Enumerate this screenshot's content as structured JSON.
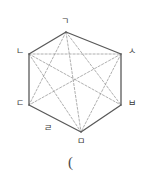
{
  "figure": {
    "name": "labeled-hexagon-with-diagonals",
    "outline_color": "#595959",
    "diagonal_color": "#9a9a9a",
    "background_color": "#ffffff",
    "vertices": [
      {
        "id": "A",
        "label": "ㄱ",
        "x": 66,
        "y": 32,
        "label_x": 61,
        "label_y": 17
      },
      {
        "id": "B",
        "label": "ㅅ",
        "x": 121,
        "y": 54,
        "label_x": 128,
        "label_y": 47
      },
      {
        "id": "C",
        "label": "ㅂ",
        "x": 121,
        "y": 105,
        "label_x": 128,
        "label_y": 99
      },
      {
        "id": "D",
        "label": "ㅁ",
        "x": 81,
        "y": 132,
        "label_x": 77,
        "label_y": 137
      },
      {
        "id": "E",
        "label": "ㄷ",
        "x": 29,
        "y": 105,
        "label_x": 16,
        "label_y": 99
      },
      {
        "id": "F",
        "label": "ㄴ",
        "x": 29,
        "y": 54,
        "label_x": 16,
        "label_y": 47
      }
    ],
    "edge_labels": [
      {
        "id": "G",
        "label": "ㄹ",
        "label_x": 44,
        "label_y": 124
      }
    ],
    "outline_edges": [
      [
        "A",
        "B"
      ],
      [
        "B",
        "C"
      ],
      [
        "C",
        "D"
      ],
      [
        "D",
        "E"
      ],
      [
        "E",
        "F"
      ],
      [
        "F",
        "A"
      ]
    ],
    "diagonals": [
      [
        "A",
        "C"
      ],
      [
        "A",
        "D"
      ],
      [
        "A",
        "E"
      ],
      [
        "F",
        "B"
      ],
      [
        "F",
        "C"
      ],
      [
        "F",
        "D"
      ],
      [
        "B",
        "E"
      ],
      [
        "B",
        "D"
      ]
    ]
  },
  "caption": {
    "text": "(",
    "x": 68,
    "y": 155
  }
}
